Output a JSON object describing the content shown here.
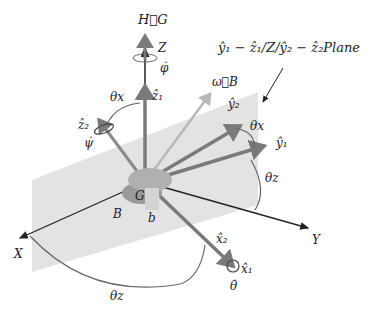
{
  "diagram": {
    "plane_label": "ŷ₁ − ẑ₁/Z/ŷ₂ − ẑ₂Plane",
    "labels": {
      "H_G": "H⃗G",
      "Z": "Z",
      "phi_dot": "φ̇",
      "z1": "ẑ₁",
      "z2": "ẑ₂",
      "psi_dot": "ψ̇",
      "theta_x_left": "θx",
      "theta_x_right": "θx",
      "omega_B": "ω⃗B",
      "y2": "ŷ₂",
      "y1": "ŷ₁",
      "theta_z_right": "θz",
      "theta_z_bottom": "θz",
      "G": "G",
      "B": "B",
      "b": "b",
      "X": "X",
      "Y": "Y",
      "x2": "x̂₂",
      "x1": "x̂₁",
      "theta_dot": "θ̇"
    },
    "colors": {
      "plane": "#e3e3e3",
      "body_axis": "#7a7a7a",
      "inertial_axis": "#222222",
      "omega": "#b8b8b8",
      "arc": "#666666"
    }
  }
}
